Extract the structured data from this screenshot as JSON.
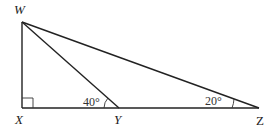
{
  "diagram": {
    "type": "geometry-triangle",
    "points": {
      "W": {
        "label": "W",
        "x": 22,
        "y": 22
      },
      "X": {
        "label": "X",
        "x": 22,
        "y": 108
      },
      "Y": {
        "label": "Y",
        "x": 119,
        "y": 108
      },
      "Z": {
        "label": "Z",
        "x": 259,
        "y": 108
      }
    },
    "segments": [
      "WX",
      "XZ",
      "WY",
      "WZ"
    ],
    "right_angle_at": "X",
    "angles": {
      "WYX": {
        "label": "40°"
      },
      "WZX": {
        "label": "20°"
      }
    }
  }
}
